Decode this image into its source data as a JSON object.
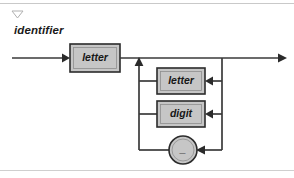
{
  "page": {
    "background": "#ffffff",
    "rule_color": "#c9c9c9"
  },
  "header": {
    "collapse_icon": "triangle-down-icon",
    "title": "identifier"
  },
  "diagram": {
    "type": "railroad-syntax-diagram",
    "box_fill": "#c6c6c6",
    "box_stroke": "#2b2b2b",
    "wire_color": "#3a3a3a",
    "entry": {
      "name": "entry-arrow",
      "label": ""
    },
    "exit": {
      "name": "exit-arrow",
      "label": ""
    },
    "nodes": [
      {
        "id": "first-letter",
        "label": "letter",
        "shape": "box",
        "role": "required-first-symbol"
      },
      {
        "id": "loop-letter",
        "label": "letter",
        "shape": "box",
        "role": "repeat-alternative"
      },
      {
        "id": "loop-digit",
        "label": "digit",
        "shape": "box",
        "role": "repeat-alternative"
      },
      {
        "id": "loop-underscore",
        "label": "_",
        "shape": "circle",
        "role": "repeat-alternative"
      }
    ]
  }
}
